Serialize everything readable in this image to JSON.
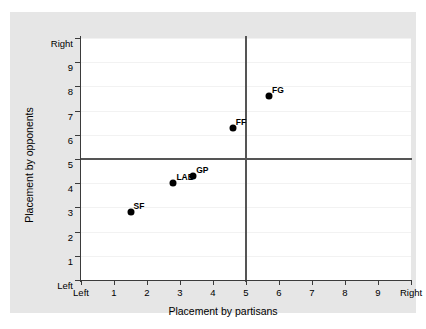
{
  "chart_data": {
    "type": "scatter",
    "title": "",
    "xlabel": "Placement by partisans",
    "ylabel": "Placement by opponents",
    "xlim": [
      0,
      10
    ],
    "ylim": [
      0,
      10
    ],
    "grid": true,
    "legend": "none",
    "x_ticks": [
      {
        "value": 0,
        "label": "Left"
      },
      {
        "value": 1,
        "label": "1"
      },
      {
        "value": 2,
        "label": "2"
      },
      {
        "value": 3,
        "label": "3"
      },
      {
        "value": 4,
        "label": "4"
      },
      {
        "value": 5,
        "label": "5"
      },
      {
        "value": 6,
        "label": "6"
      },
      {
        "value": 7,
        "label": "7"
      },
      {
        "value": 8,
        "label": "8"
      },
      {
        "value": 9,
        "label": "9"
      },
      {
        "value": 10,
        "label": "Right"
      }
    ],
    "y_ticks": [
      {
        "value": 0,
        "label": "Left"
      },
      {
        "value": 1,
        "label": "1"
      },
      {
        "value": 2,
        "label": "2"
      },
      {
        "value": 3,
        "label": "3"
      },
      {
        "value": 4,
        "label": "4"
      },
      {
        "value": 5,
        "label": "5"
      },
      {
        "value": 6,
        "label": "6"
      },
      {
        "value": 7,
        "label": "7"
      },
      {
        "value": 8,
        "label": "8"
      },
      {
        "value": 9,
        "label": "9"
      },
      {
        "value": 10,
        "label": "Right"
      }
    ],
    "reference_lines": [
      {
        "orientation": "vertical",
        "value": 5
      },
      {
        "orientation": "horizontal",
        "value": 5
      }
    ],
    "points": [
      {
        "label": "SF",
        "x": 1.5,
        "y": 2.8
      },
      {
        "label": "LAB",
        "x": 2.8,
        "y": 4.0
      },
      {
        "label": "GP",
        "x": 3.4,
        "y": 4.3
      },
      {
        "label": "FF",
        "x": 4.6,
        "y": 6.3
      },
      {
        "label": "FG",
        "x": 5.7,
        "y": 7.6
      }
    ],
    "colors": {
      "marker": "#000000",
      "panel_background": "#ffffff",
      "graph_background": "#e6e6e6",
      "axis": "#3b3b3b",
      "reference_line": "#555555",
      "gridline": "#f2f2f2"
    }
  }
}
